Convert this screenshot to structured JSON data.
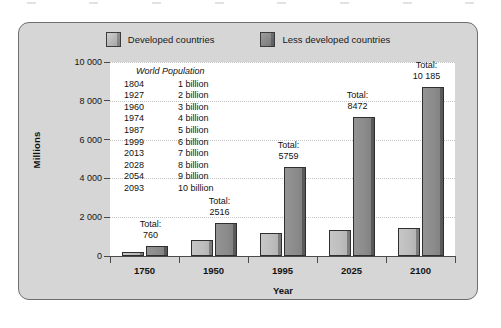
{
  "figure": {
    "background_color": "#d6d6d6",
    "plot_background_color": "#ffffff",
    "border_color": "#6e6e6e"
  },
  "legend": {
    "items": [
      {
        "label": "Developed countries",
        "color": "#b8b8b8",
        "key": "developed"
      },
      {
        "label": "Less developed countries",
        "color": "#8a8a8a",
        "key": "less_developed"
      }
    ]
  },
  "axes": {
    "ylabel": "Millions",
    "xlabel": "Year",
    "yticks": [
      "0",
      "2 000",
      "4 000",
      "6 000",
      "8 000",
      "10 000"
    ],
    "ytick_values": [
      0,
      2000,
      4000,
      6000,
      8000,
      10000
    ],
    "ylim": [
      0,
      10000
    ],
    "xticklabels": [
      "1750",
      "1950",
      "1995",
      "2025",
      "2100"
    ]
  },
  "inset": {
    "title": "World Population",
    "rows": [
      {
        "year": "1804",
        "value": "1 billion"
      },
      {
        "year": "1927",
        "value": "2 billion"
      },
      {
        "year": "1960",
        "value": "3 billion"
      },
      {
        "year": "1974",
        "value": "4 billion"
      },
      {
        "year": "1987",
        "value": "5 billion"
      },
      {
        "year": "1999",
        "value": "6 billion"
      },
      {
        "year": "2013",
        "value": "7 billion"
      },
      {
        "year": "2028",
        "value": "8 billion"
      },
      {
        "year": "2054",
        "value": "9 billion"
      },
      {
        "year": "2093",
        "value": "10 billion"
      }
    ]
  },
  "annotations": [
    {
      "label": "Total:",
      "value": "760",
      "category": "1750"
    },
    {
      "label": "Total:",
      "value": "2516",
      "category": "1950"
    },
    {
      "label": "Total:",
      "value": "5759",
      "category": "1995"
    },
    {
      "label": "Total:",
      "value": "8472",
      "category": "2025"
    },
    {
      "label": "Total:",
      "value": "10 185",
      "category": "2100"
    }
  ],
  "chart_data": {
    "type": "bar",
    "title": "",
    "xlabel": "Year",
    "ylabel": "Millions",
    "ylim": [
      0,
      10000
    ],
    "yticks": [
      0,
      2000,
      4000,
      6000,
      8000,
      10000
    ],
    "grid": true,
    "legend_position": "top",
    "categories": [
      "1750",
      "1950",
      "1995",
      "2025",
      "2100"
    ],
    "series": [
      {
        "name": "Developed countries",
        "color": "#b8b8b8",
        "values": [
          222,
          810,
          1170,
          1330,
          1450
        ]
      },
      {
        "name": "Less developed countries",
        "color": "#8a8a8a",
        "values": [
          538,
          1706,
          4589,
          7142,
          8735
        ]
      }
    ],
    "totals": [
      760,
      2516,
      5759,
      8472,
      10185
    ],
    "annotations": [
      "Total: 760",
      "Total: 2516",
      "Total: 5759",
      "Total: 8472",
      "Total: 10 185"
    ],
    "inset_table": {
      "title": "World Population",
      "columns": [
        "Year",
        "Population"
      ],
      "rows": [
        [
          "1804",
          "1 billion"
        ],
        [
          "1927",
          "2 billion"
        ],
        [
          "1960",
          "3 billion"
        ],
        [
          "1974",
          "4 billion"
        ],
        [
          "1987",
          "5 billion"
        ],
        [
          "1999",
          "6 billion"
        ],
        [
          "2013",
          "7 billion"
        ],
        [
          "2028",
          "8 billion"
        ],
        [
          "2054",
          "9 billion"
        ],
        [
          "2093",
          "10 billion"
        ]
      ]
    }
  }
}
